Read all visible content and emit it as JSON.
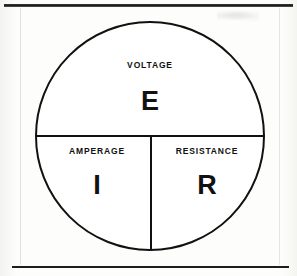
{
  "page": {
    "background_color": "#fdfdfb",
    "ink_color": "#111111"
  },
  "frame": {
    "top_rule_name": "top-horizontal-rule",
    "bottom_rule_name": "bottom-horizontal-rule"
  },
  "diagram": {
    "shape": "circle-divided-into-three-sectors",
    "stroke_color": "#111111",
    "stroke_width": 2,
    "circle": {
      "center_x": 150,
      "center_y": 136,
      "radius": 114
    },
    "divider_horizontal": {
      "name": "horizontal-diameter-line",
      "x1": 36,
      "y1": 136,
      "x2": 264,
      "y2": 136
    },
    "divider_vertical": {
      "name": "vertical-radius-line",
      "x1": 151,
      "y1": 136,
      "x2": 151,
      "y2": 250
    },
    "sectors": [
      {
        "id": "voltage",
        "position": "top-half",
        "name": "VOLTAGE",
        "symbol": "E"
      },
      {
        "id": "amperage",
        "position": "bottom-left-quadrant",
        "name": "AMPERAGE",
        "symbol": "I"
      },
      {
        "id": "resistance",
        "position": "bottom-right-quadrant",
        "name": "RESISTANCE",
        "symbol": "R"
      }
    ]
  }
}
